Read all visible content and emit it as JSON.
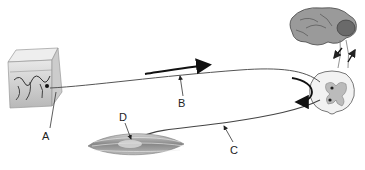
{
  "diagram": {
    "type": "reflex-arc",
    "structures": {
      "skin": "skin-block-with-receptor",
      "brain": "brain",
      "spinal_cord": "spinal-cord-cross-section",
      "muscle": "muscle"
    },
    "labels": {
      "a": "A",
      "b": "B",
      "c": "C",
      "d": "D"
    },
    "colors": {
      "line": "#555555",
      "arrow": "#111111",
      "tissue": "#9a9a9a"
    }
  }
}
